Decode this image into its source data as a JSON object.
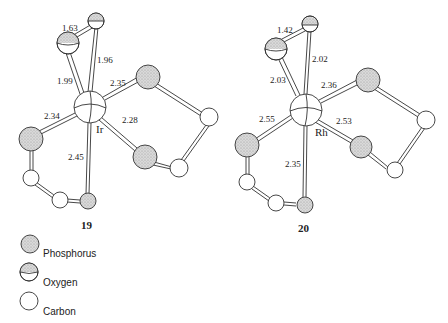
{
  "structures": [
    {
      "id": "19",
      "label": "19",
      "metal": "Ir",
      "bond_lengths": {
        "O_O": "1.63",
        "M_O_top": "1.96",
        "M_O_left": "1.99",
        "M_P_upper_right": "2.35",
        "M_P_left": "2.34",
        "M_P_lower_right": "2.28",
        "M_P_bottom": "2.45"
      }
    },
    {
      "id": "20",
      "label": "20",
      "metal": "Rh",
      "bond_lengths": {
        "O_O": "1.42",
        "M_O_top": "2.02",
        "M_O_left": "2.03",
        "M_P_upper_right": "2.36",
        "M_P_left": "2.55",
        "M_P_lower_right": "2.53",
        "M_P_bottom": "2.35"
      }
    }
  ],
  "legend": [
    {
      "symbol": "phosphorus-atom",
      "label": "Phosphorus"
    },
    {
      "symbol": "oxygen-atom",
      "label": "Oxygen"
    },
    {
      "symbol": "carbon-atom",
      "label": "Carbon"
    }
  ],
  "colors": {
    "phosphorus_fill": "#c9c9c9",
    "oxygen_fill": "#cfcfcf",
    "carbon_fill": "#ffffff",
    "stroke": "#333333"
  }
}
